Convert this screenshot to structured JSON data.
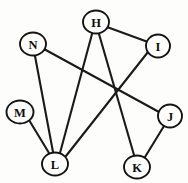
{
  "figure": {
    "kind": "undirected-graph-diagram",
    "background_color": "#fdfdfb",
    "width": 188,
    "height": 183
  },
  "style": {
    "edge_color": "#1a1a18",
    "edge_width": 2.1,
    "node_fill": "#ffffff",
    "node_stroke": "#131311",
    "node_stroke_width": 1.9,
    "label_color": "#0d0d0c",
    "node_rx": 13,
    "node_ry": 11.5
  },
  "nodes": [
    {
      "id": "H",
      "label": "H",
      "cx": 96,
      "cy": 22,
      "rx": 13,
      "ry": 11.5
    },
    {
      "id": "N",
      "label": "N",
      "cx": 33,
      "cy": 44,
      "rx": 13,
      "ry": 11.5
    },
    {
      "id": "I",
      "label": "I",
      "cx": 158,
      "cy": 46,
      "rx": 12,
      "ry": 11.5
    },
    {
      "id": "M",
      "label": "M",
      "cx": 20,
      "cy": 112,
      "rx": 13.5,
      "ry": 11.5
    },
    {
      "id": "J",
      "label": "J",
      "cx": 170,
      "cy": 116,
      "rx": 12,
      "ry": 11.5
    },
    {
      "id": "L",
      "label": "L",
      "cx": 55,
      "cy": 164,
      "rx": 13,
      "ry": 11.5
    },
    {
      "id": "K",
      "label": "K",
      "cx": 137,
      "cy": 167,
      "rx": 13,
      "ry": 11.5
    }
  ],
  "edges": [
    {
      "id": "H-I",
      "from": "H",
      "to": "I",
      "x1": 107,
      "y1": 27,
      "x2": 148,
      "y2": 42
    },
    {
      "id": "H-L",
      "from": "H",
      "to": "L",
      "x1": 92,
      "y1": 34,
      "x2": 60,
      "y2": 153
    },
    {
      "id": "H-K",
      "from": "H",
      "to": "K",
      "x1": 99,
      "y1": 34,
      "x2": 134,
      "y2": 155
    },
    {
      "id": "N-J",
      "from": "N",
      "to": "J",
      "x1": 44,
      "y1": 49,
      "x2": 159,
      "y2": 112
    },
    {
      "id": "N-L",
      "from": "N",
      "to": "L",
      "x1": 35,
      "y1": 56,
      "x2": 53,
      "y2": 152
    },
    {
      "id": "M-L",
      "from": "M",
      "to": "L",
      "x1": 29,
      "y1": 120,
      "x2": 49,
      "y2": 153
    },
    {
      "id": "I-L",
      "from": "I",
      "to": "L",
      "x1": 148,
      "y1": 52,
      "x2": 66,
      "y2": 156
    },
    {
      "id": "J-K",
      "from": "J",
      "to": "K",
      "x1": 164,
      "y1": 126,
      "x2": 145,
      "y2": 157
    }
  ],
  "adjacency_summary": {
    "H": [
      "I",
      "L",
      "K"
    ],
    "I": [
      "H",
      "L"
    ],
    "J": [
      "N",
      "K"
    ],
    "K": [
      "H",
      "J"
    ],
    "L": [
      "H",
      "N",
      "M",
      "I"
    ],
    "M": [
      "L"
    ],
    "N": [
      "J",
      "L"
    ]
  }
}
